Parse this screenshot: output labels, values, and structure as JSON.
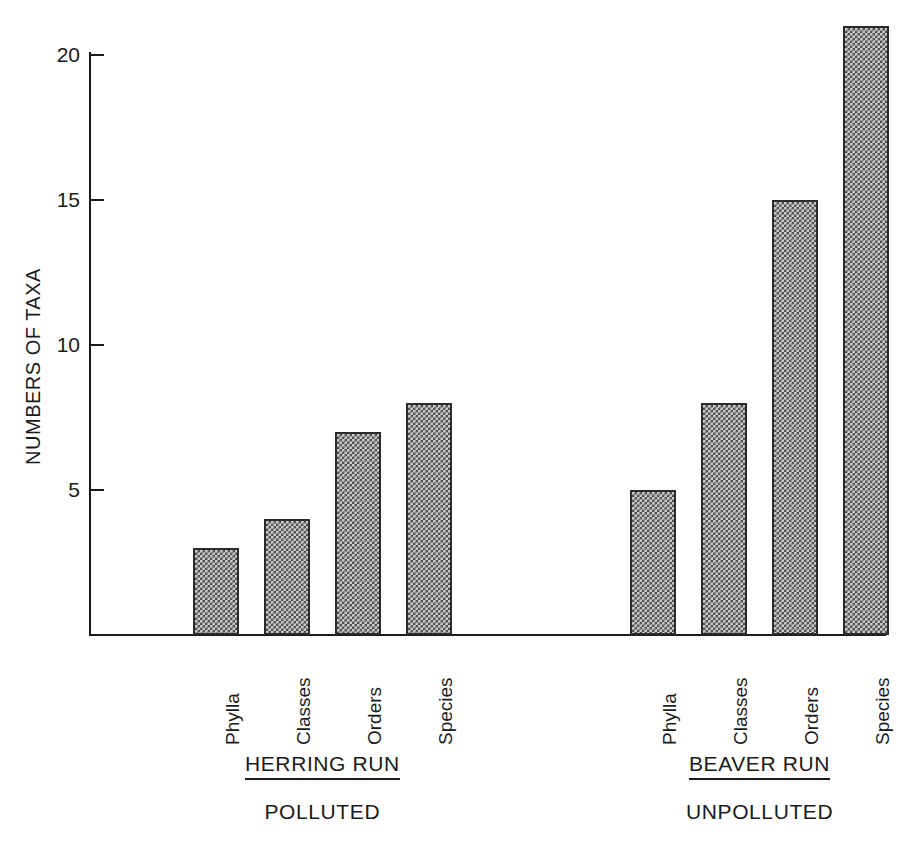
{
  "chart_data": {
    "type": "bar",
    "title": "",
    "xlabel": "",
    "ylabel": "NUMBERS OF TAXA",
    "ylim": [
      0,
      21
    ],
    "yticks": [
      5,
      10,
      15,
      20
    ],
    "ytick_labels": [
      "5",
      "10",
      "15",
      "20"
    ],
    "grid": false,
    "legend": "none",
    "categories": [
      "Phylla",
      "Classes",
      "Orders",
      "Species"
    ],
    "groups": [
      {
        "name": "HERRING RUN",
        "status": "POLLUTED",
        "values": [
          3,
          4,
          7,
          8
        ]
      },
      {
        "name": "BEAVER RUN",
        "status": "UNPOLLUTED",
        "values": [
          5,
          8,
          15,
          21
        ]
      }
    ],
    "series": [
      {
        "name": "HERRING RUN (POLLUTED)",
        "values": [
          3,
          4,
          7,
          8
        ]
      },
      {
        "name": "BEAVER RUN (UNPOLLUTED)",
        "values": [
          5,
          8,
          15,
          21
        ]
      }
    ],
    "bar_fill": "#c9c9c9",
    "bar_pattern": "checkered-halftone",
    "bar_border": "#2b2b2b",
    "axis_color": "#1a1a1a",
    "background": "#ffffff"
  },
  "axis": {
    "y_title": "NUMBERS OF TAXA",
    "ticks": [
      {
        "label": "20",
        "value": 20
      },
      {
        "label": "15",
        "value": 15
      },
      {
        "label": "10",
        "value": 10
      },
      {
        "label": "5",
        "value": 5
      }
    ]
  },
  "herring": {
    "group_label": "HERRING RUN",
    "status_label": "POLLUTED",
    "bars": [
      {
        "category": "Phylla",
        "value": 3
      },
      {
        "category": "Classes",
        "value": 4
      },
      {
        "category": "Orders",
        "value": 7
      },
      {
        "category": "Species",
        "value": 8
      }
    ]
  },
  "beaver": {
    "group_label": "BEAVER RUN",
    "status_label": "UNPOLLUTED",
    "bars": [
      {
        "category": "Phylla",
        "value": 5
      },
      {
        "category": "Classes",
        "value": 8
      },
      {
        "category": "Orders",
        "value": 15
      },
      {
        "category": "Species",
        "value": 21
      }
    ]
  }
}
